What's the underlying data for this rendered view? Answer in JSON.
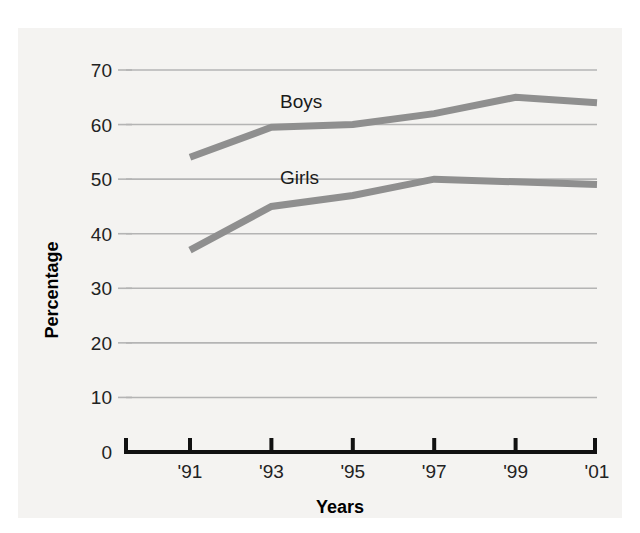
{
  "figure": {
    "background_color": "#f4f3f1",
    "page_color": "#ffffff"
  },
  "chart_data": {
    "type": "line",
    "title": "",
    "subtitle": "",
    "xlabel": "Years",
    "ylabel": "Percentage",
    "categories": [
      "'91",
      "'93",
      "'95",
      "'97",
      "'99",
      "'01"
    ],
    "x_tick_labels": [
      "'91",
      "'93",
      "'95",
      "'97",
      "'99",
      "'01"
    ],
    "y_tick_labels": [
      "0",
      "10",
      "20",
      "30",
      "40",
      "50",
      "60",
      "70"
    ],
    "y_ticks": [
      0,
      10,
      20,
      30,
      40,
      50,
      60,
      70
    ],
    "ylim": [
      0,
      70
    ],
    "grid": true,
    "grid_color": "#b4b4b4",
    "legend_position": "inline-annotation",
    "series": [
      {
        "name": "Boys",
        "label": "Boys",
        "color": "#8f8f8f",
        "values": [
          54,
          59.5,
          60,
          62,
          65,
          64
        ]
      },
      {
        "name": "Girls",
        "label": "Girls",
        "color": "#8f8f8f",
        "values": [
          37,
          45,
          47,
          50,
          49.5,
          49
        ]
      }
    ],
    "annotations": [
      {
        "text": "Boys",
        "series": "Boys",
        "x": "'94",
        "y": 66
      },
      {
        "text": "Girls",
        "series": "Girls",
        "x": "'94",
        "y": 52
      }
    ]
  },
  "axes": {
    "y_axis_title": "Percentage",
    "x_axis_title": "Years",
    "zero_label": "0"
  },
  "corner": {
    "mark": ""
  }
}
